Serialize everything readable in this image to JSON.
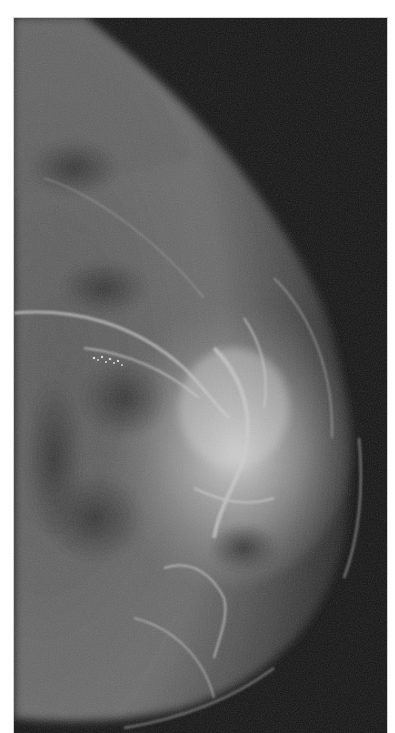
{
  "image": {
    "subject": "mammogram",
    "view": "craniocaudal",
    "colors": {
      "background": "#ffffff",
      "film_dark": "#141414",
      "tissue_mid": "#6e6e6e",
      "tissue_bright": "#e6e6e6"
    }
  }
}
